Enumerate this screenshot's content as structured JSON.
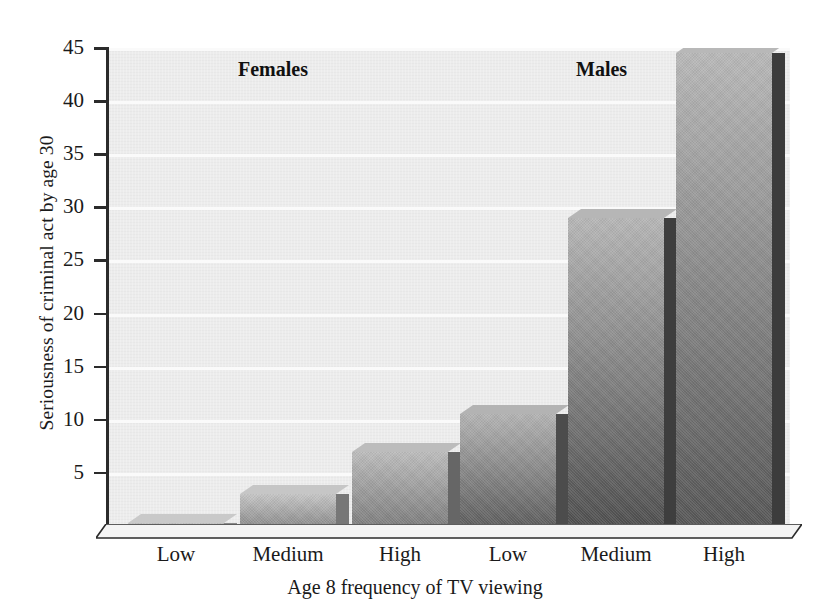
{
  "chart_data": {
    "type": "bar",
    "title": "",
    "xlabel": "Age 8 frequency of TV viewing",
    "ylabel": "Seriousness of criminal act by age 30",
    "categories": [
      "Low",
      "Medium",
      "High",
      "Low",
      "Medium",
      "High"
    ],
    "values": [
      0.3,
      3.0,
      7.0,
      10.5,
      29.0,
      44.5
    ],
    "ylim": [
      0,
      45
    ],
    "yticks": [
      0,
      5,
      10,
      15,
      20,
      25,
      30,
      35,
      40,
      45
    ],
    "ytick_labels": [
      "",
      "5",
      "10",
      "15",
      "20",
      "25",
      "30",
      "35",
      "40",
      "45"
    ],
    "grid": true,
    "grid_axis": "y",
    "legend": "none",
    "groups": [
      {
        "label": "Females",
        "categories": [
          "Low",
          "Medium",
          "High"
        ],
        "values": [
          0.3,
          3.0,
          7.0
        ]
      },
      {
        "label": "Males",
        "categories": [
          "Low",
          "Medium",
          "High"
        ],
        "values": [
          10.5,
          29.0,
          44.5
        ]
      }
    ],
    "annotations": [
      "Females",
      "Males"
    ],
    "colors": {
      "plot_background": "#ececec",
      "gridline": "#fafafa",
      "axis": "#2b2b2b",
      "bar_light": "#bdbdbd",
      "bar_dark": "#5a5a5a",
      "bar_side": "#4a4a4a",
      "text": "#1a1a1a"
    }
  },
  "axes": {
    "y_title": "Seriousness of criminal act by age 30",
    "x_title": "Age 8 frequency of TV viewing",
    "y_ticks": [
      {
        "value": 45,
        "label": "45"
      },
      {
        "value": 40,
        "label": "40"
      },
      {
        "value": 35,
        "label": "35"
      },
      {
        "value": 30,
        "label": "30"
      },
      {
        "value": 25,
        "label": "25"
      },
      {
        "value": 20,
        "label": "20"
      },
      {
        "value": 15,
        "label": "15"
      },
      {
        "value": 10,
        "label": "10"
      },
      {
        "value": 5,
        "label": "5"
      }
    ],
    "x_ticks": [
      {
        "label": "Low"
      },
      {
        "label": "Medium"
      },
      {
        "label": "High"
      },
      {
        "label": "Low"
      },
      {
        "label": "Medium"
      },
      {
        "label": "High"
      }
    ]
  },
  "group_labels": [
    {
      "label": "Females"
    },
    {
      "label": "Males"
    }
  ],
  "bars": [
    {
      "name": "females-low",
      "group": "Females",
      "category": "Low",
      "value": 0.3
    },
    {
      "name": "females-medium",
      "group": "Females",
      "category": "Medium",
      "value": 3.0
    },
    {
      "name": "females-high",
      "group": "Females",
      "category": "High",
      "value": 7.0
    },
    {
      "name": "males-low",
      "group": "Males",
      "category": "Low",
      "value": 10.5
    },
    {
      "name": "males-medium",
      "group": "Males",
      "category": "Medium",
      "value": 29.0
    },
    {
      "name": "males-high",
      "group": "Males",
      "category": "High",
      "value": 44.5
    }
  ]
}
